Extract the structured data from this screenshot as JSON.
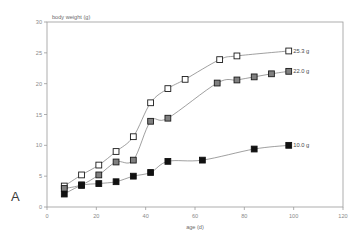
{
  "figure": {
    "panel_label": "A",
    "background_color": "#ffffff"
  },
  "chart_data": {
    "type": "scatter",
    "title": "",
    "xlabel": "age (d)",
    "ylabel": "body weight (g)",
    "xlim": [
      0,
      120
    ],
    "ylim": [
      0,
      30
    ],
    "xticks": [
      0,
      20,
      40,
      60,
      80,
      100,
      120
    ],
    "yticks": [
      0,
      5,
      10,
      15,
      20,
      25,
      30
    ],
    "grid": false,
    "legend_position": "right-inline-endpoint-labels",
    "axis_color": "#9a9a9a",
    "line_color": "#777777",
    "series": [
      {
        "name": "open-square-series",
        "marker": "open square",
        "marker_fill": "#ffffff",
        "marker_stroke": "#1a1a1a",
        "end_label": "25.3 g",
        "x": [
          7,
          14,
          21,
          28,
          35,
          42,
          49,
          56,
          70,
          77,
          98
        ],
        "y": [
          3.4,
          5.2,
          6.8,
          9.0,
          11.4,
          16.9,
          19.2,
          20.7,
          23.9,
          24.5,
          25.3
        ]
      },
      {
        "name": "gray-square-series",
        "marker": "gray filled square",
        "marker_fill": "#808080",
        "marker_stroke": "#1a1a1a",
        "end_label": "22.0 g",
        "x": [
          7,
          14,
          21,
          28,
          35,
          42,
          49,
          69,
          77,
          84,
          91,
          98
        ],
        "y": [
          3.0,
          3.6,
          5.2,
          7.3,
          7.6,
          13.9,
          14.4,
          20.1,
          20.6,
          21.1,
          21.6,
          22.0
        ],
        "note": "marker at x=14 coincides with black series marker"
      },
      {
        "name": "black-square-series",
        "marker": "black filled square",
        "marker_fill": "#111111",
        "marker_stroke": "#111111",
        "end_label": "10.0 g",
        "x": [
          7,
          14,
          21,
          28,
          35,
          42,
          49,
          63,
          84,
          98
        ],
        "y": [
          2.1,
          3.5,
          3.8,
          4.1,
          5.0,
          5.6,
          7.4,
          7.6,
          9.4,
          10.0
        ]
      }
    ]
  }
}
